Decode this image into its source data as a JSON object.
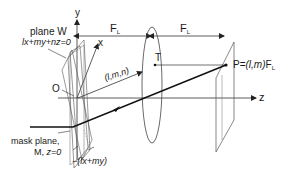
{
  "figure": {
    "type": "optical-geometry-diagram",
    "labels": {
      "plane_w_title": "plane W",
      "plane_w_equation": "lx+my+nz=0",
      "axis_y": "y",
      "axis_x": "x",
      "axis_z": "z",
      "origin": "O",
      "direction": "(l,m,n)",
      "lens_point": "T",
      "focal_length_1": "F",
      "focal_length_1_sub": "L",
      "focal_length_2": "F",
      "focal_length_2_sub": "L",
      "point_p_prefix": "P=",
      "point_p_coords": "(l,m)",
      "point_p_suffix": "F",
      "point_p_suffix_sub": "L",
      "mask_plane_line1": "mask plane,",
      "mask_plane_line2_prefix": "M, ",
      "mask_plane_line2_eq": "z=0",
      "offset": "−(lx+my)"
    },
    "colors": {
      "line": "#333333",
      "thick_ray": "#111111",
      "thin": "#666666",
      "background": "#ffffff"
    }
  }
}
